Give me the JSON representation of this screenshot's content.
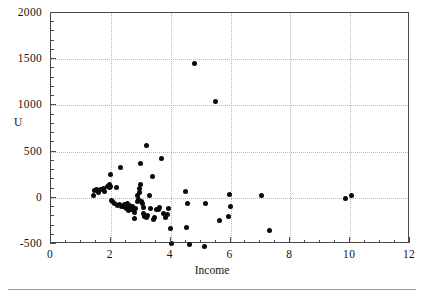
{
  "chart_data": {
    "type": "scatter",
    "title": "",
    "xlabel": "Income",
    "ylabel": "U",
    "xlim": [
      0,
      12
    ],
    "ylim": [
      -500,
      2000
    ],
    "grid": true,
    "legend": null,
    "xticks": [
      0,
      2,
      4,
      6,
      8,
      10,
      12
    ],
    "xtick_labels": [
      "0",
      "2",
      "4",
      "6",
      "8",
      "10",
      "12"
    ],
    "yticks": [
      -500,
      0,
      500,
      1000,
      1500,
      2000
    ],
    "ytick_labels": [
      "-500",
      "0",
      "500",
      "1000",
      "1500",
      "2000"
    ],
    "x_minor_interval": 0.5,
    "y_minor_interval": 100,
    "marker": "filled-circle",
    "marker_color": "#0a0a0a",
    "series": [
      {
        "name": "U vs Income",
        "points": [
          [
            1.42,
            30
          ],
          [
            1.47,
            75
          ],
          [
            1.52,
            90
          ],
          [
            1.58,
            60
          ],
          [
            1.66,
            95
          ],
          [
            1.74,
            105
          ],
          [
            1.8,
            70
          ],
          [
            1.88,
            120
          ],
          [
            1.94,
            140
          ],
          [
            1.97,
            115
          ],
          [
            1.99,
            255
          ],
          [
            2.0,
            125
          ],
          [
            2.03,
            -30
          ],
          [
            2.05,
            -45
          ],
          [
            2.12,
            -60
          ],
          [
            2.18,
            110
          ],
          [
            2.22,
            -80
          ],
          [
            2.28,
            -70
          ],
          [
            2.33,
            330
          ],
          [
            2.36,
            -95
          ],
          [
            2.42,
            -90
          ],
          [
            2.45,
            -75
          ],
          [
            2.48,
            -105
          ],
          [
            2.52,
            -115
          ],
          [
            2.55,
            -60
          ],
          [
            2.58,
            -140
          ],
          [
            2.62,
            -85
          ],
          [
            2.66,
            -100
          ],
          [
            2.7,
            -130
          ],
          [
            2.74,
            -95
          ],
          [
            2.78,
            -160
          ],
          [
            2.8,
            -220
          ],
          [
            2.84,
            -115
          ],
          [
            2.88,
            -45
          ],
          [
            2.9,
            25
          ],
          [
            2.92,
            -20
          ],
          [
            2.95,
            60
          ],
          [
            2.97,
            100
          ],
          [
            2.98,
            145
          ],
          [
            3.0,
            375
          ],
          [
            3.02,
            -35
          ],
          [
            3.05,
            -60
          ],
          [
            3.08,
            -105
          ],
          [
            3.1,
            -175
          ],
          [
            3.14,
            -200
          ],
          [
            3.18,
            565
          ],
          [
            3.2,
            -215
          ],
          [
            3.24,
            -190
          ],
          [
            3.28,
            30
          ],
          [
            3.32,
            -120
          ],
          [
            3.38,
            235
          ],
          [
            3.42,
            -230
          ],
          [
            3.46,
            -215
          ],
          [
            3.52,
            -125
          ],
          [
            3.58,
            -130
          ],
          [
            3.64,
            -110
          ],
          [
            3.7,
            430
          ],
          [
            3.76,
            -175
          ],
          [
            3.82,
            -215
          ],
          [
            3.88,
            -185
          ],
          [
            3.92,
            -120
          ],
          [
            3.98,
            -335
          ],
          [
            4.02,
            -495
          ],
          [
            4.48,
            70
          ],
          [
            4.52,
            -325
          ],
          [
            4.56,
            -60
          ],
          [
            4.62,
            -500
          ],
          [
            4.8,
            1450
          ],
          [
            5.12,
            -525
          ],
          [
            5.18,
            -65
          ],
          [
            5.5,
            1040
          ],
          [
            5.62,
            -245
          ],
          [
            5.92,
            -205
          ],
          [
            5.96,
            40
          ],
          [
            6.0,
            -90
          ],
          [
            7.05,
            20
          ],
          [
            7.3,
            -350
          ],
          [
            9.84,
            -12
          ],
          [
            10.05,
            30
          ]
        ]
      }
    ]
  },
  "axis": {
    "frame_color": "#4a4a4a",
    "grid_color": "#b9b9b9"
  }
}
